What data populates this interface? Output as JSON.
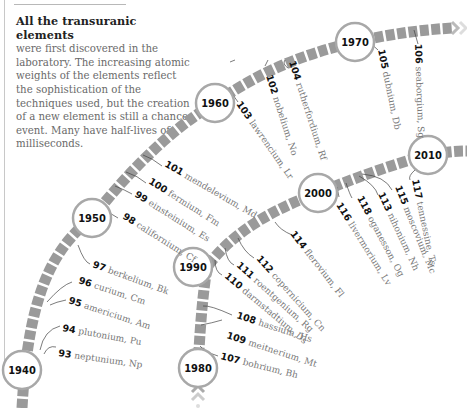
{
  "intro": {
    "heading": "All the transuranic elements",
    "body": "were first discovered in the laboratory. The increasing atomic weights of the elements reflect the sophistication of the techniques used, but the creation of a new element is still a chance event. Many have half-lives of milliseconds."
  },
  "colors": {
    "track": "#9a9a9a",
    "circle_stroke": "#a8a8a8",
    "year_text": "#111111",
    "element_number": "#111111",
    "element_name": "#777777"
  },
  "years": [
    "1940",
    "1950",
    "1960",
    "1970",
    "1980",
    "1990",
    "2000",
    "2010"
  ],
  "elements": [
    {
      "number": "93",
      "name": "neptunium, Np"
    },
    {
      "number": "94",
      "name": "plutonium, Pu"
    },
    {
      "number": "95",
      "name": "americium, Am"
    },
    {
      "number": "96",
      "name": "curium, Cm"
    },
    {
      "number": "97",
      "name": "berkelium, Bk"
    },
    {
      "number": "98",
      "name": "californium, Cf"
    },
    {
      "number": "99",
      "name": "einsteinium, Es"
    },
    {
      "number": "100",
      "name": "fermium, Fm"
    },
    {
      "number": "101",
      "name": "mendelevium, Md"
    },
    {
      "number": "102",
      "name": "nobelium, No"
    },
    {
      "number": "103",
      "name": "lawrencium, Lr"
    },
    {
      "number": "104",
      "name": "rutherfordium, Rf"
    },
    {
      "number": "105",
      "name": "dubnium, Db"
    },
    {
      "number": "106",
      "name": "seaborgium, Sg"
    },
    {
      "number": "107",
      "name": "bohrium, Bh"
    },
    {
      "number": "108",
      "name": "hassium, Hs"
    },
    {
      "number": "109",
      "name": "meitnerium, Mt"
    },
    {
      "number": "110",
      "name": "darmstadtium, Ds"
    },
    {
      "number": "111",
      "name": "roentgenium, Rg"
    },
    {
      "number": "112",
      "name": "copernicium, Cn"
    },
    {
      "number": "113",
      "name": "nihonium, Nh"
    },
    {
      "number": "114",
      "name": "flerovium, Fl"
    },
    {
      "number": "115",
      "name": "moscovium, Mc"
    },
    {
      "number": "116",
      "name": "livermorium, Lv"
    },
    {
      "number": "117",
      "name": "tennessine, Ts"
    },
    {
      "number": "118",
      "name": "oganesson, Og"
    }
  ]
}
